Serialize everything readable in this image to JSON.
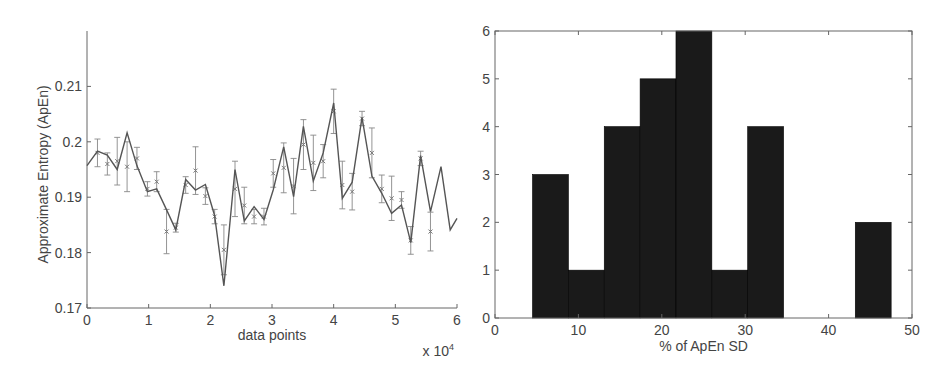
{
  "chart_data": [
    {
      "type": "line",
      "title": "",
      "xlabel": "data points",
      "ylabel": "Approximate Entropy (ApEn)",
      "x_multiplier_label": "x 10^4",
      "xlim": [
        0,
        6
      ],
      "ylim": [
        0.17,
        0.22
      ],
      "xticks": [
        0,
        1,
        2,
        3,
        4,
        5,
        6
      ],
      "yticks": [
        0.17,
        0.18,
        0.19,
        0.2,
        0.21
      ],
      "ytick_labels": [
        "0.17",
        "0.18",
        "0.19",
        "0.2",
        "0.21"
      ],
      "grid": false,
      "series": [
        {
          "name": "ApEn",
          "style": "line",
          "color": "#555555",
          "x": [
            0,
            0.17,
            0.33,
            0.49,
            0.65,
            0.81,
            0.98,
            1.13,
            1.29,
            1.44,
            1.6,
            1.76,
            1.92,
            2.07,
            2.22,
            2.4,
            2.55,
            2.71,
            2.87,
            3.02,
            3.19,
            3.35,
            3.51,
            3.67,
            3.83,
            4.0,
            4.14,
            4.3,
            4.46,
            4.62,
            4.78,
            4.94,
            5.1,
            5.25,
            5.41,
            5.57,
            5.74,
            5.89,
            6.0
          ],
          "y": [
            0.1957,
            0.1983,
            0.1976,
            0.195,
            0.2016,
            0.1957,
            0.191,
            0.1915,
            0.1877,
            0.1841,
            0.1932,
            0.1913,
            0.1923,
            0.1867,
            0.174,
            0.195,
            0.1857,
            0.1883,
            0.186,
            0.1913,
            0.1991,
            0.1901,
            0.2028,
            0.1929,
            0.198,
            0.207,
            0.1898,
            0.1927,
            0.2044,
            0.1938,
            0.1907,
            0.1871,
            0.1886,
            0.1818,
            0.1975,
            0.1874,
            0.1955,
            0.1841,
            0.1862
          ]
        },
        {
          "name": "mean ± SD",
          "style": "errorbar",
          "marker": "x",
          "color": "#888888",
          "x": [
            0.17,
            0.33,
            0.49,
            0.65,
            0.81,
            0.98,
            1.13,
            1.29,
            1.44,
            1.6,
            1.76,
            1.92,
            2.07,
            2.22,
            2.4,
            2.55,
            2.71,
            2.87,
            3.02,
            3.19,
            3.35,
            3.51,
            3.67,
            3.83,
            4.0,
            4.14,
            4.3,
            4.46,
            4.62,
            4.78,
            4.94,
            5.1,
            5.25,
            5.41,
            5.57
          ],
          "y": [
            0.198,
            0.196,
            0.1965,
            0.1955,
            0.197,
            0.1915,
            0.1928,
            0.1838,
            0.1845,
            0.1922,
            0.1948,
            0.1902,
            0.1865,
            0.1805,
            0.1915,
            0.1885,
            0.1865,
            0.1865,
            0.1943,
            0.1953,
            0.192,
            0.1995,
            0.1962,
            0.1965,
            0.2055,
            0.1922,
            0.191,
            0.2042,
            0.198,
            0.1915,
            0.1898,
            0.1895,
            0.1822,
            0.197,
            0.1838
          ],
          "err": [
            0.0025,
            0.002,
            0.0043,
            0.0045,
            0.002,
            0.0013,
            0.0018,
            0.004,
            0.0008,
            0.0015,
            0.0043,
            0.0015,
            0.0013,
            0.0045,
            0.005,
            0.0033,
            0.0013,
            0.0015,
            0.0025,
            0.0045,
            0.005,
            0.0045,
            0.005,
            0.003,
            0.004,
            0.0043,
            0.0033,
            0.0013,
            0.0045,
            0.0025,
            0.004,
            0.0015,
            0.0025,
            0.0013,
            0.0035
          ]
        }
      ]
    },
    {
      "type": "bar",
      "subtype": "histogram",
      "title": "",
      "xlabel": "% of ApEn SD",
      "ylabel": "",
      "xlim": [
        0,
        50
      ],
      "ylim": [
        0,
        6
      ],
      "xticks": [
        0,
        10,
        20,
        30,
        40,
        50
      ],
      "yticks": [
        0,
        1,
        2,
        3,
        4,
        5,
        6
      ],
      "grid": false,
      "bar_color": "#1a1a1a",
      "bin_edges": [
        4.5,
        8.8,
        13.1,
        17.4,
        21.7,
        26.0,
        30.3,
        34.6,
        38.9,
        43.2,
        47.5
      ],
      "categories": [
        "4.5-8.8",
        "8.8-13.1",
        "13.1-17.4",
        "17.4-21.7",
        "21.7-26.0",
        "26.0-30.3",
        "30.3-34.6",
        "34.6-38.9",
        "38.9-43.2",
        "43.2-47.5"
      ],
      "values": [
        3,
        1,
        4,
        5,
        6,
        1,
        4,
        0,
        0,
        2
      ]
    }
  ]
}
